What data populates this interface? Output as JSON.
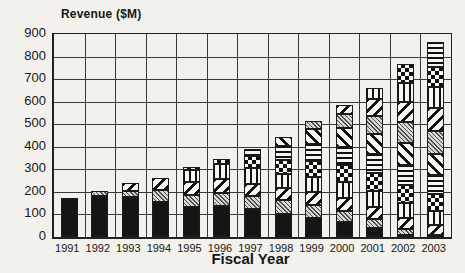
{
  "chart_data": {
    "type": "bar",
    "stacked": true,
    "title": "Revenue ($M)",
    "xlabel": "Fiscal Year",
    "ylabel": "",
    "ylim": [
      0,
      900
    ],
    "ytick_interval": 100,
    "yticks": [
      0,
      100,
      200,
      300,
      400,
      500,
      600,
      700,
      800,
      900
    ],
    "grid": true,
    "legend": "none",
    "categories": [
      "1991",
      "1992",
      "1993",
      "1994",
      "1995",
      "1996",
      "1997",
      "1998",
      "1999",
      "2000",
      "2001",
      "2002",
      "2003"
    ],
    "totals": [
      175,
      205,
      240,
      260,
      310,
      345,
      390,
      445,
      515,
      585,
      660,
      765,
      865
    ],
    "series": [
      {
        "name": "series-1",
        "pattern": "solid-black",
        "values": [
          175,
          182,
          178,
          156,
          135,
          138,
          124,
          104,
          86,
          65,
          38,
          10,
          0
        ]
      },
      {
        "name": "series-2",
        "pattern": "gray-dither",
        "values": [
          0,
          23,
          28,
          52,
          50,
          55,
          58,
          60,
          55,
          50,
          40,
          25,
          10
        ]
      },
      {
        "name": "series-3",
        "pattern": "diagonal-left",
        "values": [
          0,
          0,
          34,
          52,
          58,
          62,
          55,
          52,
          60,
          60,
          55,
          50,
          45
        ]
      },
      {
        "name": "series-4",
        "pattern": "vertical-stripes",
        "values": [
          0,
          0,
          0,
          0,
          52,
          70,
          68,
          62,
          65,
          70,
          70,
          65,
          60
        ]
      },
      {
        "name": "series-5",
        "pattern": "checkerboard",
        "values": [
          0,
          0,
          0,
          0,
          15,
          20,
          55,
          65,
          70,
          75,
          80,
          80,
          75
        ]
      },
      {
        "name": "series-6",
        "pattern": "horizontal-stripes",
        "values": [
          0,
          0,
          0,
          0,
          0,
          0,
          30,
          62,
          75,
          80,
          85,
          90,
          85
        ]
      },
      {
        "name": "series-7",
        "pattern": "diagonal-right",
        "values": [
          0,
          0,
          0,
          0,
          0,
          0,
          0,
          40,
          70,
          85,
          90,
          95,
          95
        ]
      },
      {
        "name": "series-8",
        "pattern": "gray-dither",
        "values": [
          0,
          0,
          0,
          0,
          0,
          0,
          0,
          0,
          34,
          60,
          80,
          95,
          100
        ]
      },
      {
        "name": "series-9",
        "pattern": "diagonal-left",
        "values": [
          0,
          0,
          0,
          0,
          0,
          0,
          0,
          0,
          0,
          40,
          72,
          90,
          100
        ]
      },
      {
        "name": "series-10",
        "pattern": "vertical-stripes",
        "values": [
          0,
          0,
          0,
          0,
          0,
          0,
          0,
          0,
          0,
          0,
          50,
          85,
          95
        ]
      },
      {
        "name": "series-11",
        "pattern": "checkerboard",
        "values": [
          0,
          0,
          0,
          0,
          0,
          0,
          0,
          0,
          0,
          0,
          0,
          80,
          90
        ]
      },
      {
        "name": "series-12",
        "pattern": "horizontal-stripes",
        "values": [
          0,
          0,
          0,
          0,
          0,
          0,
          0,
          0,
          0,
          0,
          0,
          0,
          110
        ]
      }
    ]
  },
  "colors": {
    "background": "#f2f1ec",
    "ink": "#161616",
    "gridline": "#3a3a3a"
  }
}
